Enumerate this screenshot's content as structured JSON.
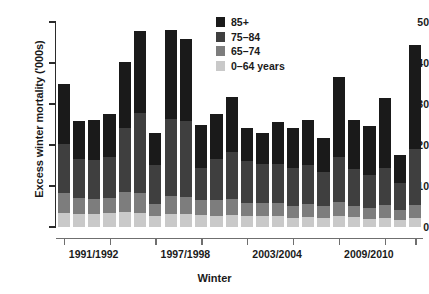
{
  "chart_data": {
    "type": "bar",
    "stacked": true,
    "title": "",
    "xlabel": "Winter",
    "ylabel": "Excess winter mortality ('000s)",
    "ylim": [
      0,
      50
    ],
    "yticks": [
      0,
      10,
      20,
      30,
      40,
      50
    ],
    "grid": false,
    "legend_position": "top-right",
    "categories": [
      "1991/1992",
      "1992/1993",
      "1993/1994",
      "1994/1995",
      "1995/1996",
      "1996/1997",
      "1997/1998",
      "1998/1999",
      "1999/2000",
      "2000/2001",
      "2001/2002",
      "2002/2003",
      "2003/2004",
      "2004/2005",
      "2005/2006",
      "2006/2007",
      "2007/2008",
      "2008/2009",
      "2009/2010",
      "2010/2011",
      "2011/2012",
      "2012/2013",
      "2013/2014",
      "2014/2015"
    ],
    "xtick_labels": [
      "1991/1992",
      "1997/1998",
      "2003/2004",
      "2009/2010"
    ],
    "xtick_indices": [
      0,
      6,
      12,
      18
    ],
    "series": [
      {
        "name": "0–64 years",
        "color": "#c9c9c9",
        "values": [
          3.4,
          3.2,
          3.1,
          3.3,
          3.6,
          3.4,
          2.6,
          3.2,
          3.2,
          2.9,
          2.8,
          3.0,
          2.6,
          2.7,
          2.6,
          2.3,
          2.5,
          2.3,
          2.8,
          2.4,
          2.0,
          2.3,
          1.8,
          2.3
        ]
      },
      {
        "name": "65–74",
        "color": "#7d7d7d",
        "values": [
          5.0,
          3.9,
          3.8,
          3.9,
          5.0,
          4.8,
          3.1,
          4.3,
          4.2,
          3.6,
          3.8,
          3.9,
          3.3,
          3.1,
          3.2,
          2.9,
          3.1,
          2.8,
          3.4,
          2.8,
          2.6,
          3.0,
          2.3,
          3.1
        ]
      },
      {
        "name": "75–84",
        "color": "#3f3f3f",
        "values": [
          11.9,
          9.4,
          9.5,
          10.0,
          15.5,
          19.5,
          9.5,
          18.8,
          18.4,
          7.9,
          10.0,
          11.3,
          10.2,
          9.6,
          9.5,
          9.1,
          9.6,
          8.4,
          11.0,
          9.0,
          8.1,
          9.2,
          6.6,
          13.7
        ]
      },
      {
        "name": "85+",
        "color": "#1a1a1a",
        "values": [
          14.7,
          9.3,
          9.6,
          10.3,
          16.1,
          20.0,
          7.8,
          21.7,
          20.0,
          10.6,
          10.9,
          13.5,
          8.0,
          7.5,
          10.3,
          9.8,
          10.8,
          8.2,
          19.4,
          12.0,
          11.9,
          17.0,
          6.8,
          25.4
        ]
      }
    ],
    "totals": [
      35.0,
      25.8,
      26.0,
      27.5,
      40.2,
      47.7,
      23.0,
      48.0,
      45.8,
      25.0,
      27.5,
      31.7,
      24.1,
      22.9,
      25.6,
      24.1,
      26.0,
      21.7,
      36.6,
      26.2,
      24.6,
      31.5,
      17.5,
      44.5
    ]
  }
}
